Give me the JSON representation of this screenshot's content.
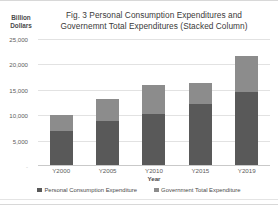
{
  "chart_data": {
    "type": "bar",
    "stacked": true,
    "title": "Fig. 3 Personal Consumption Expenditures and Governemnt Total Expenditures (Stacked Column)",
    "title_line1": "Fig. 3 Personal Consumption Expenditures and",
    "title_line2": "Governemnt Total Expenditures (Stacked Column)",
    "xlabel": "Year",
    "ylabel": "Billion Dollars",
    "ylabel_line1": "Billion",
    "ylabel_line2": "Dollars",
    "categories": [
      "Y2000",
      "Y2005",
      "Y2010",
      "Y2015",
      "Y2019"
    ],
    "series": [
      {
        "name": "Personal Consumption Expenditure",
        "color": "#595959",
        "values": [
          6800,
          8800,
          10200,
          12300,
          14600
        ]
      },
      {
        "name": "Government Total Expenditure",
        "color": "#8c8c8c",
        "values": [
          3200,
          4300,
          5700,
          4000,
          7100
        ]
      }
    ],
    "totals": [
      10000,
      13100,
      15900,
      16300,
      21700
    ],
    "ylim": [
      0,
      25000
    ],
    "yticks": [
      {
        "value": 25000,
        "label": "25,000"
      },
      {
        "value": 20000,
        "label": "20,000"
      },
      {
        "value": 15000,
        "label": "15,000"
      },
      {
        "value": 10000,
        "label": "10,000"
      },
      {
        "value": 5000,
        "label": "5,000"
      },
      {
        "value": 0,
        "label": "-"
      }
    ],
    "grid": true,
    "legend_position": "bottom"
  },
  "legend": {
    "items": [
      {
        "label": "Personal Consumption Expenditure",
        "color": "#595959"
      },
      {
        "label": "Government Total Expenditure",
        "color": "#8c8c8c"
      }
    ]
  }
}
